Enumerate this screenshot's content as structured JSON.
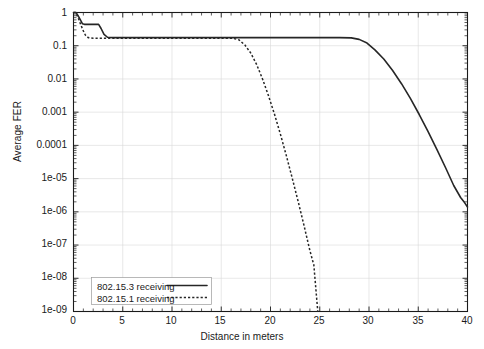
{
  "chart_data": {
    "type": "line",
    "title": "",
    "xlabel": "Distance in meters",
    "ylabel": "Average FER",
    "xlim": [
      0,
      40
    ],
    "ylim": [
      1e-09,
      1
    ],
    "yscale": "log",
    "xscale": "linear",
    "grid": true,
    "legend_position": "bottom-left",
    "xticks": [
      0,
      5,
      10,
      15,
      20,
      25,
      30,
      35,
      40
    ],
    "xticklabels": [
      "0",
      "5",
      "10",
      "15",
      "20",
      "25",
      "30",
      "35",
      "40"
    ],
    "yticks": [
      1,
      0.1,
      0.01,
      0.001,
      0.0001,
      1e-05,
      1e-06,
      1e-07,
      1e-08,
      1e-09
    ],
    "yticklabels": [
      "1",
      "0.1",
      "0.01",
      "0.001",
      "0.0001",
      "1e-05",
      "1e-06",
      "1e-07",
      "1e-08",
      "1e-09"
    ],
    "series": [
      {
        "name": "802.15.3 receiving",
        "style": "solid",
        "color": "#262626",
        "points": [
          [
            0.0,
            1.0
          ],
          [
            0.25,
            1.0
          ],
          [
            0.45,
            0.82
          ],
          [
            0.7,
            0.6
          ],
          [
            0.9,
            0.46
          ],
          [
            1.1,
            0.44
          ],
          [
            2.0,
            0.44
          ],
          [
            2.55,
            0.44
          ],
          [
            2.8,
            0.33
          ],
          [
            3.1,
            0.22
          ],
          [
            3.45,
            0.18
          ],
          [
            4.0,
            0.175
          ],
          [
            8.0,
            0.175
          ],
          [
            12.0,
            0.175
          ],
          [
            16.0,
            0.175
          ],
          [
            20.0,
            0.175
          ],
          [
            24.0,
            0.175
          ],
          [
            27.0,
            0.175
          ],
          [
            28.2,
            0.172
          ],
          [
            29.0,
            0.155
          ],
          [
            29.8,
            0.12
          ],
          [
            30.6,
            0.075
          ],
          [
            31.5,
            0.04
          ],
          [
            32.4,
            0.018
          ],
          [
            33.3,
            0.0072
          ],
          [
            34.2,
            0.0026
          ],
          [
            35.1,
            0.00085
          ],
          [
            36.0,
            0.00026
          ],
          [
            36.9,
            7.5e-05
          ],
          [
            37.8,
            2.05e-05
          ],
          [
            38.6,
            6.2e-06
          ],
          [
            39.3,
            2.7e-06
          ],
          [
            39.7,
            1.9e-06
          ],
          [
            40.0,
            1.4e-06
          ]
        ]
      },
      {
        "name": "802.15.1 receiving",
        "style": "dotted",
        "color": "#262626",
        "points": [
          [
            0.0,
            1.0
          ],
          [
            0.2,
            1.0
          ],
          [
            0.45,
            0.72
          ],
          [
            0.7,
            0.46
          ],
          [
            0.95,
            0.3
          ],
          [
            1.2,
            0.21
          ],
          [
            1.5,
            0.175
          ],
          [
            2.0,
            0.168
          ],
          [
            4.0,
            0.168
          ],
          [
            8.0,
            0.168
          ],
          [
            12.0,
            0.168
          ],
          [
            15.0,
            0.168
          ],
          [
            16.2,
            0.167
          ],
          [
            16.8,
            0.15
          ],
          [
            17.4,
            0.105
          ],
          [
            18.0,
            0.06
          ],
          [
            18.6,
            0.027
          ],
          [
            19.2,
            0.0098
          ],
          [
            19.8,
            0.0031
          ],
          [
            20.4,
            0.00088
          ],
          [
            21.0,
            0.00022
          ],
          [
            21.6,
            5e-05
          ],
          [
            22.2,
            1.05e-05
          ],
          [
            22.8,
            2.1e-06
          ],
          [
            23.4,
            3.9e-07
          ],
          [
            24.0,
            6.8e-08
          ],
          [
            24.4,
            2.5e-08
          ],
          [
            24.8,
            1e-09
          ]
        ]
      }
    ]
  },
  "legend": {
    "entries": [
      {
        "label": "802.15.3 receiving",
        "style": "solid"
      },
      {
        "label": "802.15.1 receiving",
        "style": "dotted"
      }
    ]
  }
}
